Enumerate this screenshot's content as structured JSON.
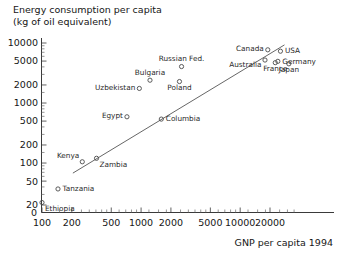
{
  "chart_data": {
    "type": "scatter",
    "title": "Energy consumption per capita (kg of oil equivalent)",
    "title_line1": "Energy consumption per capita",
    "title_line2": "(kg of oil equivalent)",
    "xlabel": "GNP per capita 1994",
    "ylabel": "Energy consumption per capita (kg of oil equivalent)",
    "xscale": "log",
    "yscale": "log",
    "xlim": [
      100,
      40000
    ],
    "ylim": [
      20,
      10000
    ],
    "grid": false,
    "legend": "none",
    "xticks": [
      100,
      200,
      500,
      1000,
      2000,
      5000,
      10000,
      20000
    ],
    "xtick_labels": [
      "100",
      "200",
      "500",
      "1000",
      "2000",
      "5000",
      "10000",
      "20000"
    ],
    "yticks": [
      20,
      50,
      100,
      200,
      500,
      1000,
      2000,
      5000,
      10000
    ],
    "ytick_labels": [
      "20",
      "50",
      "100",
      "200",
      "500",
      "1000",
      "2000",
      "5000",
      "10000"
    ],
    "y_origin_label": "0",
    "x_origin_label": "0",
    "points": [
      {
        "label": "Ethiopia",
        "x": 100,
        "y": 22,
        "label_pos": "below-right"
      },
      {
        "label": "Tanzania",
        "x": 145,
        "y": 37,
        "label_pos": "right"
      },
      {
        "label": "Kenya",
        "x": 255,
        "y": 105,
        "label_pos": "above-left"
      },
      {
        "label": "Zambia",
        "x": 355,
        "y": 120,
        "label_pos": "below-right"
      },
      {
        "label": "Egypt",
        "x": 720,
        "y": 590,
        "label_pos": "left"
      },
      {
        "label": "Columbia",
        "x": 1600,
        "y": 540,
        "label_pos": "right"
      },
      {
        "label": "Uzbekistan",
        "x": 960,
        "y": 1750,
        "label_pos": "left"
      },
      {
        "label": "Bulgaria",
        "x": 1230,
        "y": 2400,
        "label_pos": "above"
      },
      {
        "label": "Poland",
        "x": 2440,
        "y": 2280,
        "label_pos": "below"
      },
      {
        "label": "Russian Fed.",
        "x": 2560,
        "y": 4050,
        "label_pos": "above"
      },
      {
        "label": "Canada",
        "x": 19000,
        "y": 7700,
        "label_pos": "left"
      },
      {
        "label": "USA",
        "x": 25500,
        "y": 7300,
        "label_pos": "right"
      },
      {
        "label": "Australia",
        "x": 17800,
        "y": 5200,
        "label_pos": "below-left"
      },
      {
        "label": "France",
        "x": 22600,
        "y": 4700,
        "label_pos": "below"
      },
      {
        "label": "Germany",
        "x": 24000,
        "y": 4950,
        "label_pos": "right"
      },
      {
        "label": "Japan",
        "x": 31000,
        "y": 4500,
        "label_pos": "below"
      }
    ],
    "trend_line": {
      "description": "fitted straight regression line across the log-log plot",
      "x_start": 205,
      "y_start": 68,
      "x_end": 28000,
      "y_end": 9300
    },
    "colors": {
      "background": "#ffffff",
      "text": "#161616",
      "marker_stroke": "#4a4a4a",
      "axis": "#3a3a3a",
      "trend_line": "#555555"
    }
  }
}
